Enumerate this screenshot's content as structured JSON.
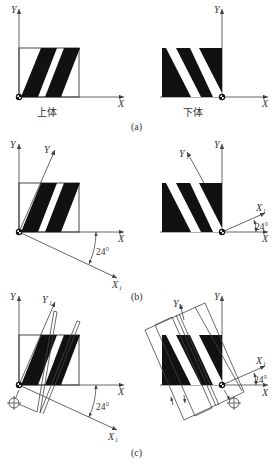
{
  "figure": {
    "panels": [
      {
        "id": "a",
        "caption": "(a)",
        "left": {
          "label": "上体",
          "x_axis": "X",
          "y_axis": "Y"
        },
        "right": {
          "label": "下体",
          "x_axis": "X",
          "y_axis": "Y"
        }
      },
      {
        "id": "b",
        "caption": "(b)",
        "left": {
          "x_axis": "X",
          "y_axis": "Y",
          "x1_axis": "X",
          "x1_sub": "1",
          "y1_axis": "Y",
          "y1_sub": "1",
          "angle": "24°"
        },
        "right": {
          "x_axis": "X",
          "y_axis": "Y",
          "x1_axis": "X",
          "x1_sub": "1",
          "y1_axis": "Y",
          "y1_sub": "1",
          "angle": "24°"
        }
      },
      {
        "id": "c",
        "caption": "(c)",
        "left": {
          "x_axis": "X",
          "y_axis": "Y",
          "x1_axis": "X",
          "x1_sub": "1",
          "y1_axis": "Y",
          "y1_sub": "1",
          "angle": "24°"
        },
        "right": {
          "x_axis": "X",
          "y_axis": "Y",
          "x1_axis": "X",
          "x1_sub": "1",
          "y1_axis": "Y",
          "y1_sub": "1",
          "angle": "24°"
        }
      }
    ]
  }
}
